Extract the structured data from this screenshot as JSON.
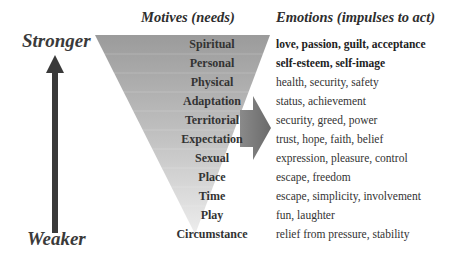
{
  "scale": {
    "top_label": "Stronger",
    "bottom_label": "Weaker"
  },
  "headers": {
    "motives": "Motives (needs)",
    "emotions": "Emotions (impulses to act)"
  },
  "rows": [
    {
      "motive": "Spiritual",
      "emotion": "love, passion, guilt, acceptance",
      "bold": true
    },
    {
      "motive": "Personal",
      "emotion": "self-esteem, self-image",
      "bold": true
    },
    {
      "motive": "Physical",
      "emotion": "health, security, safety",
      "bold": false
    },
    {
      "motive": "Adaptation",
      "emotion": "status, achievement",
      "bold": false
    },
    {
      "motive": "Territorial",
      "emotion": "security, greed, power",
      "bold": false
    },
    {
      "motive": "Expectation",
      "emotion": "trust, hope, faith, belief",
      "bold": false
    },
    {
      "motive": "Sexual",
      "emotion": "expression, pleasure, control",
      "bold": false
    },
    {
      "motive": "Place",
      "emotion": "escape, freedom",
      "bold": false
    },
    {
      "motive": "Time",
      "emotion": "escape, simplicity, involvement",
      "bold": false
    },
    {
      "motive": "Play",
      "emotion": "fun, laughter",
      "bold": false
    },
    {
      "motive": "Circumstance",
      "emotion": "relief from pressure, stability",
      "bold": false
    }
  ],
  "colors": {
    "funnel_top": "#9a9a9a",
    "funnel_bottom": "#e6e6e6",
    "arrow": "#3a3a3a",
    "right_arrow": "#7a7a7a"
  }
}
